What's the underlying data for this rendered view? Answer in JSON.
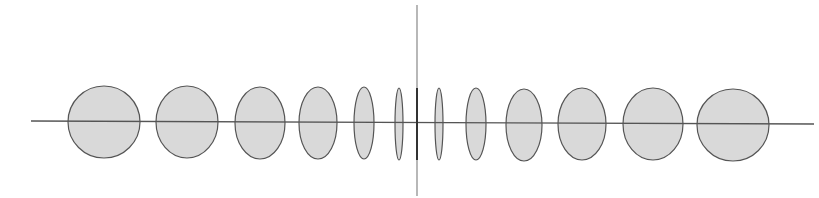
{
  "diagram": {
    "colors": {
      "background": "#ffffff",
      "ellipse_fill": "#d9d9d9",
      "ellipse_stroke": "#555555",
      "axis": "#555555",
      "center_line_dark": "#333333",
      "center_line_light": "#888888"
    },
    "horizontal_axis": {
      "x1": 31,
      "y1": 121,
      "x2": 814,
      "y2": 124
    },
    "vertical_axis": {
      "x": 417,
      "y1": 5,
      "y2": 196,
      "dark_y1": 88,
      "dark_y2": 160
    },
    "ellipses": [
      {
        "cx": 104,
        "cy": 122,
        "rx": 36,
        "ry": 36
      },
      {
        "cx": 187,
        "cy": 122,
        "rx": 31,
        "ry": 36
      },
      {
        "cx": 260,
        "cy": 123,
        "rx": 25,
        "ry": 36
      },
      {
        "cx": 318,
        "cy": 123,
        "rx": 19,
        "ry": 36
      },
      {
        "cx": 364,
        "cy": 123,
        "rx": 10,
        "ry": 36
      },
      {
        "cx": 399,
        "cy": 124,
        "rx": 4,
        "ry": 36
      },
      {
        "cx": 439,
        "cy": 124,
        "rx": 4,
        "ry": 36
      },
      {
        "cx": 476,
        "cy": 124,
        "rx": 10,
        "ry": 36
      },
      {
        "cx": 524,
        "cy": 125,
        "rx": 18,
        "ry": 36
      },
      {
        "cx": 582,
        "cy": 124,
        "rx": 24,
        "ry": 36
      },
      {
        "cx": 653,
        "cy": 124,
        "rx": 30,
        "ry": 36
      },
      {
        "cx": 733,
        "cy": 125,
        "rx": 36,
        "ry": 36
      }
    ]
  }
}
